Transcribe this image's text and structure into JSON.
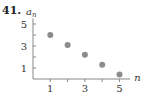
{
  "problem_number": "41.",
  "chart_data": {
    "type": "scatter",
    "title": "",
    "xlabel": "n",
    "ylabel": "a_n",
    "x": [
      1,
      2,
      3,
      4,
      5
    ],
    "values": [
      4.0,
      3.1,
      2.2,
      1.3,
      0.4
    ],
    "x_ticks": [
      1,
      2,
      3,
      4,
      5
    ],
    "x_tick_labels": [
      "1",
      "3",
      "5"
    ],
    "y_ticks": [
      1,
      2,
      3,
      4,
      5
    ],
    "y_tick_labels": [
      "1",
      "3",
      "5"
    ],
    "xlim": [
      0,
      5.5
    ],
    "ylim": [
      0,
      5.5
    ],
    "grid": false,
    "legend": null,
    "point_color": "#8c8c8c"
  }
}
